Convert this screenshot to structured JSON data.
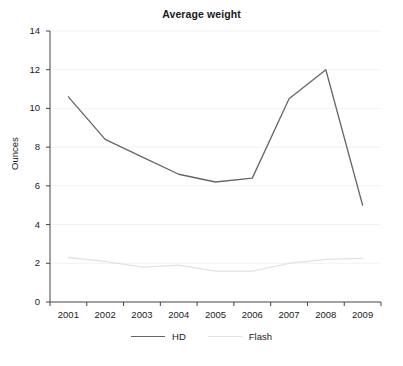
{
  "chart_data": {
    "type": "line",
    "title": "Average weight",
    "xlabel": "",
    "ylabel": "Ounces",
    "categories": [
      "2001",
      "2002",
      "2003",
      "2004",
      "2005",
      "2006",
      "2007",
      "2008",
      "2009"
    ],
    "x": [
      2001,
      2002,
      2003,
      2004,
      2005,
      2006,
      2007,
      2008,
      2009
    ],
    "series": [
      {
        "name": "HD",
        "color": "#666666",
        "values": [
          10.6,
          8.4,
          7.5,
          6.6,
          6.2,
          6.4,
          10.5,
          12.0,
          5.0
        ]
      },
      {
        "name": "Flash",
        "color": "#e2e2e2",
        "values": [
          2.3,
          2.1,
          1.8,
          1.9,
          1.6,
          1.6,
          2.0,
          2.2,
          2.25
        ]
      }
    ],
    "ylim": [
      0,
      14
    ],
    "yticks": [
      0,
      2,
      4,
      6,
      8,
      10,
      12,
      14
    ],
    "ytick_labels": [
      "0",
      "2",
      "4",
      "6",
      "8",
      "10",
      "12",
      "14"
    ],
    "grid": "horizontal",
    "grid_color": "#f2f2f2",
    "axis_color": "#444444",
    "legend_position": "bottom-center",
    "background": "#ffffff"
  },
  "legend": {
    "entries": [
      {
        "label": "HD"
      },
      {
        "label": "Flash"
      }
    ]
  }
}
